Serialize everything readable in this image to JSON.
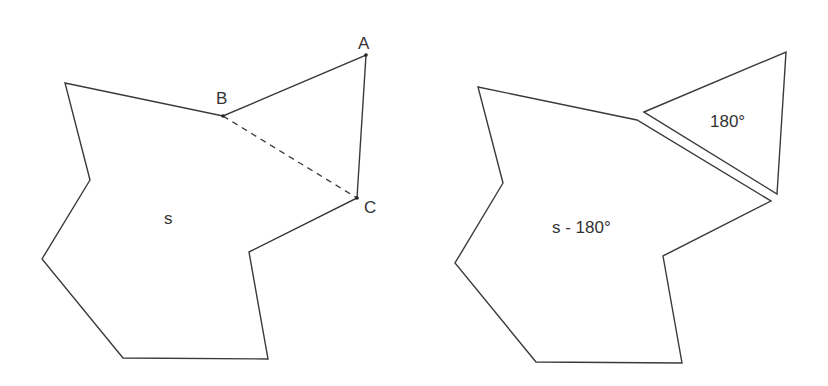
{
  "left_figure": {
    "polygon_points": "65,83 223,116 366,55 357,198 249,252 268,359 123,358 42,259 90,180",
    "diagonal": {
      "from": "B",
      "to": "C"
    },
    "vertices": {
      "A": {
        "label": "A",
        "x": 366,
        "y": 55
      },
      "B": {
        "label": "B",
        "x": 223,
        "y": 116
      },
      "C": {
        "label": "C",
        "x": 357,
        "y": 198
      }
    },
    "area_label": "s"
  },
  "right_figure": {
    "polygon_points": "478,87 637,120 771,201 663,256 682,363 536,362 455,263 503,183",
    "triangle_points": "644,112 786,52 777,194",
    "polygon_label": "s - 180°",
    "triangle_label": "180°"
  },
  "colors": {
    "stroke": "#3a3a3a",
    "text": "#333333",
    "background": "#ffffff"
  }
}
